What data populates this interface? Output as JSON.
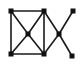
{
  "figure": {
    "background_color": "#ffffff",
    "edge_color": "#1a1a1a",
    "node_color": "#111111",
    "node_shape": "square",
    "node_size_px": 5,
    "edge_width_px": 1.6,
    "canvas": {
      "width": 84,
      "height": 66
    }
  },
  "chart_data": {
    "type": "diagram",
    "xlabel": "",
    "ylabel": "",
    "node_count": 7,
    "edge_count": 10,
    "nodes": [
      {
        "id": "tl",
        "label": "top-left",
        "x": 11,
        "y": 11
      },
      {
        "id": "tr",
        "label": "top-right",
        "x": 44,
        "y": 11
      },
      {
        "id": "bl",
        "label": "bottom-left",
        "x": 11,
        "y": 54
      },
      {
        "id": "br",
        "label": "bottom-right",
        "x": 44,
        "y": 54
      },
      {
        "id": "c",
        "label": "center",
        "x": 28,
        "y": 34
      },
      {
        "id": "x",
        "label": "right-cross",
        "x": 59,
        "y": 34
      },
      {
        "id": "p1",
        "label": "pendant-upper",
        "x": 73,
        "y": 11
      },
      {
        "id": "p2",
        "label": "pendant-lower",
        "x": 72,
        "y": 56
      }
    ],
    "edges": [
      {
        "from": "tl",
        "to": "tr",
        "kind": "square-top"
      },
      {
        "from": "tr",
        "to": "br",
        "kind": "square-right"
      },
      {
        "from": "br",
        "to": "bl",
        "kind": "square-bottom"
      },
      {
        "from": "bl",
        "to": "tl",
        "kind": "square-left"
      },
      {
        "from": "tl",
        "to": "c",
        "kind": "diagonal"
      },
      {
        "from": "tr",
        "to": "c",
        "kind": "diagonal"
      },
      {
        "from": "bl",
        "to": "c",
        "kind": "diagonal"
      },
      {
        "from": "br",
        "to": "c",
        "kind": "diagonal"
      },
      {
        "from": "tr",
        "to": "x",
        "kind": "bridge"
      },
      {
        "from": "br",
        "to": "x",
        "kind": "bridge"
      },
      {
        "from": "x",
        "to": "p1",
        "kind": "pendant"
      },
      {
        "from": "x",
        "to": "p2",
        "kind": "pendant"
      }
    ]
  }
}
